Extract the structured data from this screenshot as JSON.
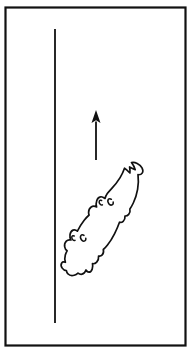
{
  "figure": {
    "background_color": "#ffffff",
    "ink_color": "#111111",
    "width": 192,
    "height": 353,
    "frame": {
      "name": "rectangular border frame",
      "x": 5.5,
      "y": 7.5,
      "width": 180,
      "height": 338,
      "stroke_width": 2.2,
      "color": "#111111"
    },
    "reference_line": {
      "name": "vertical reference line",
      "x": 55,
      "y_top": 29,
      "y_bottom": 323,
      "stroke_width": 1.8,
      "color": "#111111"
    },
    "arrow": {
      "name": "upward direction arrow",
      "direction": "up",
      "x": 96,
      "tip_y": 110,
      "tail_y": 160,
      "head_width": 9,
      "head_height": 13,
      "shaft_width": 1.8,
      "color": "#111111"
    },
    "animal": {
      "name": "salamander outline",
      "orientation": "diagonal, head lower-left, tail upper-right",
      "outline_color": "#111111",
      "fill_color": "#ffffff",
      "outline_stroke_width": 1.7,
      "mark_stroke_width": 1.5,
      "outline_path": "M 131.5 162.5 C 133.4 165.0 134.6 167.4 135.2 169.6 C 133.3 168.9 131.4 168.0 129.6 167.0 C 130.0 169.4 130.2 171.4 129.9 173.0 C 128.0 171.0 126.2 169.3 124.5 168.2 C 123.4 171.4 121.9 174.6 120.1 177.6 C 117.6 181.7 114.7 185.3 111.6 188.6 C 110.0 190.3 108.5 191.9 107.3 193.6 C 106.2 195.2 105.4 196.8 105.0 198.5 C 103.4 197.2 101.8 196.5 100.4 196.8 C 98.8 197.1 97.5 198.5 96.8 200.5 C 96.0 202.7 96.0 205.1 96.6 206.9 C 94.6 206.0 92.7 206.0 91.2 207.0 C 89.6 208.1 88.6 210.2 88.6 212.4 C 88.6 213.3 88.8 214.2 89.1 215.0 C 87.3 216.6 85.7 218.4 84.2 220.3 C 81.6 223.6 79.4 227.3 77.4 231.2 C 76.0 229.9 74.4 229.5 73.0 230.1 C 71.4 230.8 70.3 232.6 70.0 234.7 C 69.7 236.7 70.1 238.7 71.0 240.0 C 69.2 239.5 67.5 239.9 66.3 241.1 C 64.9 242.5 64.3 244.8 64.7 246.9 C 65.0 248.6 65.9 250.0 67.1 250.8 C 66.3 252.2 65.7 253.6 65.3 255.0 C 64.6 257.6 64.6 260.1 65.4 262.3 C 63.8 261.6 62.5 261.8 61.7 262.9 C 60.8 264.2 61.0 266.3 62.2 268.1 C 63.3 269.7 64.9 270.6 66.4 270.6 C 66.6 271.9 67.1 273.0 67.9 273.8 C 69.4 275.5 71.8 276.0 74.2 275.3 C 75.6 274.9 76.9 274.1 78.0 273.1 C 79.3 274.1 80.7 274.5 82.0 274.2 C 83.8 273.8 85.2 272.2 86.0 270.0 C 86.8 271.4 87.8 272.2 88.9 272.2 C 90.3 272.2 91.5 271.0 92.2 269.1 C 92.8 267.4 92.9 265.4 92.5 263.7 C 94.1 263.9 95.6 263.3 96.7 262.1 C 98.1 260.6 98.8 258.3 98.6 256.0 C 100.0 256.3 101.3 255.9 102.2 254.9 C 103.4 253.6 103.8 251.5 103.3 249.5 C 104.8 248.2 106.2 246.7 107.5 245.0 C 110.1 241.7 112.4 237.9 114.5 233.8 C 116.4 230.0 118.1 226.1 119.5 222.2 C 120.9 222.6 122.2 222.2 123.2 221.3 C 124.5 220.1 125.2 218.1 125.0 216.0 C 126.5 216.1 127.8 215.5 128.7 214.4 C 129.9 213.0 130.3 210.9 129.9 209.0 C 131.2 207.1 132.3 205.1 133.3 203.0 C 135.4 198.6 136.8 194.0 137.6 189.4 C 138.5 184.4 138.6 179.4 138.0 174.7 C 139.9 174.9 141.4 174.3 142.2 173.1 C 143.1 171.8 143.0 169.8 142.0 167.9 C 141.0 166.0 139.2 164.4 137.2 163.4 C 135.4 162.5 133.4 162.1 131.5 162.5 Z",
      "marks": [
        {
          "name": "head mark left",
          "path": "M 74.2 236.0 C 73.2 235.4 72.3 235.6 71.9 236.5 C 71.5 237.5 71.9 238.9 72.8 239.8 C 73.5 240.5 74.4 240.7 75.0 240.3"
        },
        {
          "name": "head mark right",
          "path": "M 84.0 235.4 C 82.9 234.5 81.7 234.5 81.0 235.4 C 80.2 236.5 80.4 238.4 81.4 239.8 C 82.2 240.9 83.4 241.4 84.3 241.1 C 85.4 240.8 86.0 239.6 85.8 238.2"
        },
        {
          "name": "midbody mark left",
          "path": "M 101.6 200.5 C 100.6 199.9 99.7 200.1 99.3 201.0 C 98.9 202.0 99.3 203.4 100.2 204.3 C 100.9 205.0 101.8 205.2 102.4 204.8"
        },
        {
          "name": "midbody mark right",
          "path": "M 111.4 199.3 C 110.3 198.4 109.1 198.4 108.4 199.3 C 107.6 200.4 107.8 202.3 108.8 203.7 C 109.6 204.8 110.8 205.3 111.7 205.0 C 112.8 204.7 113.4 203.5 113.2 202.1"
        }
      ]
    }
  }
}
